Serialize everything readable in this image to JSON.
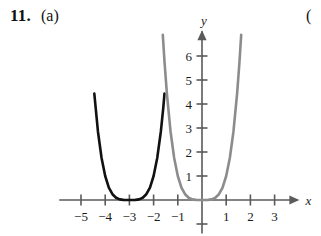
{
  "problem": {
    "number": "11.",
    "part": "(a)",
    "next_part_partial": "("
  },
  "chart_data": {
    "type": "line",
    "title": "",
    "xlabel": "x",
    "ylabel": "y",
    "xlim": [
      -5.9,
      3.9
    ],
    "ylim": [
      -1.4,
      7.2
    ],
    "grid": false,
    "legend": "none",
    "x_ticks": [
      -5,
      -4,
      -3,
      -2,
      -1,
      1,
      2,
      3
    ],
    "x_tick_labels": [
      "−5",
      "−4",
      "−3",
      "−2",
      "−1",
      "1",
      "2",
      "3"
    ],
    "y_ticks": [
      1,
      2,
      3,
      4,
      5,
      6
    ],
    "y_tick_labels": [
      "1",
      "2",
      "3",
      "4",
      "5",
      "6"
    ],
    "y_negative_tick": -1,
    "axis_color": "#5a5a5a",
    "series": [
      {
        "name": "shifted-quartic",
        "color": "#111111",
        "linewidth": 2.6,
        "equation_form": "y = (x + 3)^4",
        "vertex": [
          -3,
          0
        ],
        "x": [
          -4.45,
          -4.3,
          -4.15,
          -4.0,
          -3.85,
          -3.7,
          -3.55,
          -3.4,
          -3.25,
          -3.1,
          -3.0,
          -2.9,
          -2.75,
          -2.6,
          -2.45,
          -2.3,
          -2.15,
          -2.0,
          -1.85,
          -1.7,
          -1.6,
          -1.55
        ],
        "y": [
          4.437,
          2.856,
          1.749,
          1.0,
          0.52,
          0.24,
          0.0915,
          0.0256,
          0.0039,
          0.0001,
          0.0,
          0.0001,
          0.0039,
          0.0256,
          0.0915,
          0.24,
          0.52,
          1.0,
          1.749,
          2.856,
          3.842,
          4.437
        ]
      },
      {
        "name": "base-quartic",
        "color": "#8c8c8c",
        "linewidth": 2.6,
        "equation_form": "y = x^4",
        "vertex": [
          0,
          0
        ],
        "x": [
          -1.62,
          -1.55,
          -1.45,
          -1.3,
          -1.15,
          -1.0,
          -0.85,
          -0.7,
          -0.55,
          -0.4,
          -0.25,
          -0.1,
          0.0,
          0.1,
          0.25,
          0.4,
          0.55,
          0.7,
          0.85,
          1.0,
          1.15,
          1.3,
          1.45,
          1.55,
          1.62
        ],
        "y": [
          6.887,
          5.77,
          4.42,
          2.856,
          1.749,
          1.0,
          0.52,
          0.24,
          0.0915,
          0.0256,
          0.0039,
          0.0001,
          0.0,
          0.0001,
          0.0039,
          0.0256,
          0.0915,
          0.24,
          0.52,
          1.0,
          1.749,
          2.856,
          4.42,
          5.77,
          6.887
        ]
      }
    ]
  }
}
